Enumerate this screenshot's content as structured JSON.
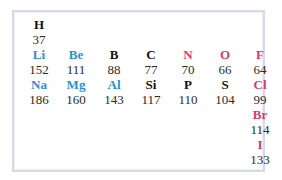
{
  "colors": {
    "metal": "#2b8fd3",
    "nonmetal_halogen": "#d63a70",
    "other": "#111111"
  },
  "elements": [
    {
      "symbol": "H",
      "radius": "37",
      "category": "other",
      "col": 0,
      "row": 0
    },
    {
      "symbol": "Li",
      "radius": "152",
      "category": "metal",
      "col": 0,
      "row": 1
    },
    {
      "symbol": "Be",
      "radius": "111",
      "category": "metal",
      "col": 1,
      "row": 1
    },
    {
      "symbol": "B",
      "radius": "88",
      "category": "other",
      "col": 2,
      "row": 1
    },
    {
      "symbol": "C",
      "radius": "77",
      "category": "other",
      "col": 3,
      "row": 1
    },
    {
      "symbol": "N",
      "radius": "70",
      "category": "nonmetal",
      "col": 4,
      "row": 1
    },
    {
      "symbol": "O",
      "radius": "66",
      "category": "nonmetal",
      "col": 5,
      "row": 1
    },
    {
      "symbol": "F",
      "radius": "64",
      "category": "nonmetal",
      "col": 6,
      "row": 1
    },
    {
      "symbol": "Na",
      "radius": "186",
      "category": "metal",
      "col": 0,
      "row": 2
    },
    {
      "symbol": "Mg",
      "radius": "160",
      "category": "metal",
      "col": 1,
      "row": 2
    },
    {
      "symbol": "Al",
      "radius": "143",
      "category": "metal",
      "col": 2,
      "row": 2
    },
    {
      "symbol": "Si",
      "radius": "117",
      "category": "other",
      "col": 3,
      "row": 2
    },
    {
      "symbol": "P",
      "radius": "110",
      "category": "other",
      "col": 4,
      "row": 2
    },
    {
      "symbol": "S",
      "radius": "104",
      "category": "other",
      "col": 5,
      "row": 2
    },
    {
      "symbol": "Cl",
      "radius": "99",
      "category": "nonmetal",
      "col": 6,
      "row": 2
    },
    {
      "symbol": "Br",
      "radius": "114",
      "category": "nonmetal",
      "col": 6,
      "row": 3
    },
    {
      "symbol": "I",
      "radius": "133",
      "category": "nonmetal",
      "col": 6,
      "row": 4
    }
  ]
}
